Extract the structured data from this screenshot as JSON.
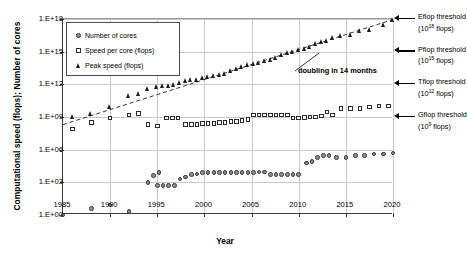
{
  "chart_data": {
    "type": "scatter",
    "title": "",
    "xlabel": "Year",
    "ylabel": "Computational speed (flops); Number of cores",
    "xlim": [
      1985,
      2020
    ],
    "ylim": [
      0,
      18
    ],
    "yscale": "log",
    "xticks": [
      1985,
      1990,
      1995,
      2000,
      2005,
      2010,
      2015,
      2020
    ],
    "yticks": [
      "1.E+00",
      "1.E+03",
      "1.E+06",
      "1.E+09",
      "1.E+12",
      "1.E+15",
      "1.E+18"
    ],
    "ytick_exponents": [
      0,
      3,
      6,
      9,
      12,
      15,
      18
    ],
    "grid": true,
    "legend_position": "upper left",
    "series": [
      {
        "name": "Number of cores",
        "marker": "circle",
        "points": [
          [
            1985,
            1
          ],
          [
            1988,
            4
          ],
          [
            1990,
            8
          ],
          [
            1992,
            2
          ],
          [
            1994,
            1000
          ],
          [
            1995,
            512
          ],
          [
            1995.6,
            512
          ],
          [
            1996.2,
            512
          ],
          [
            1996.8,
            512
          ],
          [
            1994.6,
            4096
          ],
          [
            1995.2,
            8192
          ],
          [
            1997.4,
            2000
          ],
          [
            1998,
            3000
          ],
          [
            1998.6,
            5000
          ],
          [
            1999.2,
            6000
          ],
          [
            1999.8,
            8000
          ],
          [
            2000.4,
            8000
          ],
          [
            2001,
            8000
          ],
          [
            2001.6,
            8000
          ],
          [
            2002.2,
            8000
          ],
          [
            2002.8,
            8000
          ],
          [
            2003.4,
            8000
          ],
          [
            2004,
            8000
          ],
          [
            2004.6,
            8000
          ],
          [
            2005.2,
            8000
          ],
          [
            2005.8,
            9000
          ],
          [
            2006.4,
            9000
          ],
          [
            2007,
            5000
          ],
          [
            2007.6,
            5000
          ],
          [
            2008.2,
            5000
          ],
          [
            2008.8,
            5000
          ],
          [
            2009.4,
            5000
          ],
          [
            2010,
            5000
          ],
          [
            2010.8,
            60000
          ],
          [
            2011.4,
            80000
          ],
          [
            2012,
            200000
          ],
          [
            2012.6,
            300000
          ],
          [
            2013.2,
            300000
          ],
          [
            2014,
            200000
          ],
          [
            2015,
            200000
          ],
          [
            2016,
            300000
          ],
          [
            2017,
            300000
          ],
          [
            2018,
            400000
          ],
          [
            2019,
            400000
          ],
          [
            2020,
            500000
          ]
        ]
      },
      {
        "name": "Speed per core (flops)",
        "marker": "square",
        "points": [
          [
            1986,
            80000000
          ],
          [
            1988,
            300000000
          ],
          [
            1990,
            800000000
          ],
          [
            1992,
            1500000000
          ],
          [
            1993,
            2000000000
          ],
          [
            1994,
            200000000
          ],
          [
            1995,
            150000000
          ],
          [
            1996,
            800000000
          ],
          [
            1996.6,
            800000000
          ],
          [
            1997.2,
            800000000
          ],
          [
            1998,
            200000000
          ],
          [
            1998.6,
            200000000
          ],
          [
            1999.2,
            200000000
          ],
          [
            1999.8,
            250000000
          ],
          [
            2000.4,
            250000000
          ],
          [
            2001,
            250000000
          ],
          [
            2001.6,
            300000000
          ],
          [
            2002.2,
            300000000
          ],
          [
            2002.8,
            400000000
          ],
          [
            2003.4,
            400000000
          ],
          [
            2004,
            500000000
          ],
          [
            2004.6,
            600000000
          ],
          [
            2005.2,
            1500000000
          ],
          [
            2005.8,
            1500000000
          ],
          [
            2006.4,
            1500000000
          ],
          [
            2007,
            1500000000
          ],
          [
            2007.6,
            1500000000
          ],
          [
            2008.2,
            1500000000
          ],
          [
            2008.8,
            1500000000
          ],
          [
            2009.4,
            800000000
          ],
          [
            2010,
            800000000
          ],
          [
            2010.6,
            900000000
          ],
          [
            2011.2,
            1000000000
          ],
          [
            2011.8,
            1000000000
          ],
          [
            2012.4,
            1200000000
          ],
          [
            2013,
            3000000000
          ],
          [
            2013.6,
            1500000000
          ],
          [
            2014.5,
            6000000000
          ],
          [
            2015.5,
            6000000000
          ],
          [
            2016.5,
            6000000000
          ],
          [
            2017.5,
            8000000000
          ],
          [
            2018.5,
            10000000000
          ],
          [
            2019.5,
            10000000000
          ]
        ]
      },
      {
        "name": "Peak speed (flops)",
        "marker": "triangle",
        "points": [
          [
            1986,
            1000000000
          ],
          [
            1988,
            2000000000
          ],
          [
            1990,
            10000000000
          ],
          [
            1992,
            100000000000
          ],
          [
            1993,
            150000000000
          ],
          [
            1994,
            400000000000
          ],
          [
            1995,
            600000000000
          ],
          [
            1995.6,
            700000000000
          ],
          [
            1996.2,
            800000000000
          ],
          [
            1996.8,
            900000000000
          ],
          [
            1997.4,
            1500000000000
          ],
          [
            1998,
            2000000000000
          ],
          [
            1998.6,
            2500000000000
          ],
          [
            1999.2,
            3000000000000
          ],
          [
            1999.8,
            4000000000000
          ],
          [
            2000.4,
            5000000000000
          ],
          [
            2001,
            6000000000000
          ],
          [
            2001.6,
            8000000000000
          ],
          [
            2002.2,
            10000000000000
          ],
          [
            2002.8,
            20000000000000
          ],
          [
            2003.4,
            30000000000000
          ],
          [
            2004,
            40000000000000
          ],
          [
            2004.6,
            60000000000000
          ],
          [
            2005.2,
            80000000000000
          ],
          [
            2005.8,
            100000000000000
          ],
          [
            2006.4,
            150000000000000
          ],
          [
            2007,
            200000000000000
          ],
          [
            2007.6,
            300000000000000
          ],
          [
            2008.2,
            500000000000000
          ],
          [
            2008.8,
            800000000000000
          ],
          [
            2009.4,
            1000000000000000
          ],
          [
            2010,
            1500000000000000
          ],
          [
            2010.6,
            2000000000000000
          ],
          [
            2011.2,
            3000000000000000
          ],
          [
            2011.8,
            5000000000000000
          ],
          [
            2012.4,
            8000000000000000
          ],
          [
            2013,
            10000000000000000
          ],
          [
            2013.6,
            20000000000000000
          ],
          [
            2014.5,
            30000000000000000
          ],
          [
            2015.5,
            40000000000000000
          ],
          [
            2016.5,
            80000000000000000
          ],
          [
            2017.5,
            100000000000000000
          ],
          [
            2019,
            300000000000000000
          ],
          [
            2020,
            800000000000000000
          ]
        ]
      }
    ],
    "trendline": {
      "label": "doubling in 14 months",
      "style": "dashed",
      "from": [
        1985,
        200000000
      ],
      "to": [
        2020,
        900000000000000000
      ]
    },
    "annotations": [
      {
        "name": "eflop",
        "label": "Eflop threshold",
        "sub": "(10",
        "exp": "18",
        "unit": " flops)",
        "exponent": 18
      },
      {
        "name": "pflop",
        "label": "Pflop threshold",
        "sub": "(10",
        "exp": "15",
        "unit": " flops)",
        "exponent": 15
      },
      {
        "name": "tflop",
        "label": "Tflop threshold",
        "sub": "(10",
        "exp": "12",
        "unit": " flops)",
        "exponent": 12
      },
      {
        "name": "gflop",
        "label": "Gflop threshold",
        "sub": "(10",
        "exp": "9",
        "unit": " flops)",
        "exponent": 9
      }
    ]
  }
}
